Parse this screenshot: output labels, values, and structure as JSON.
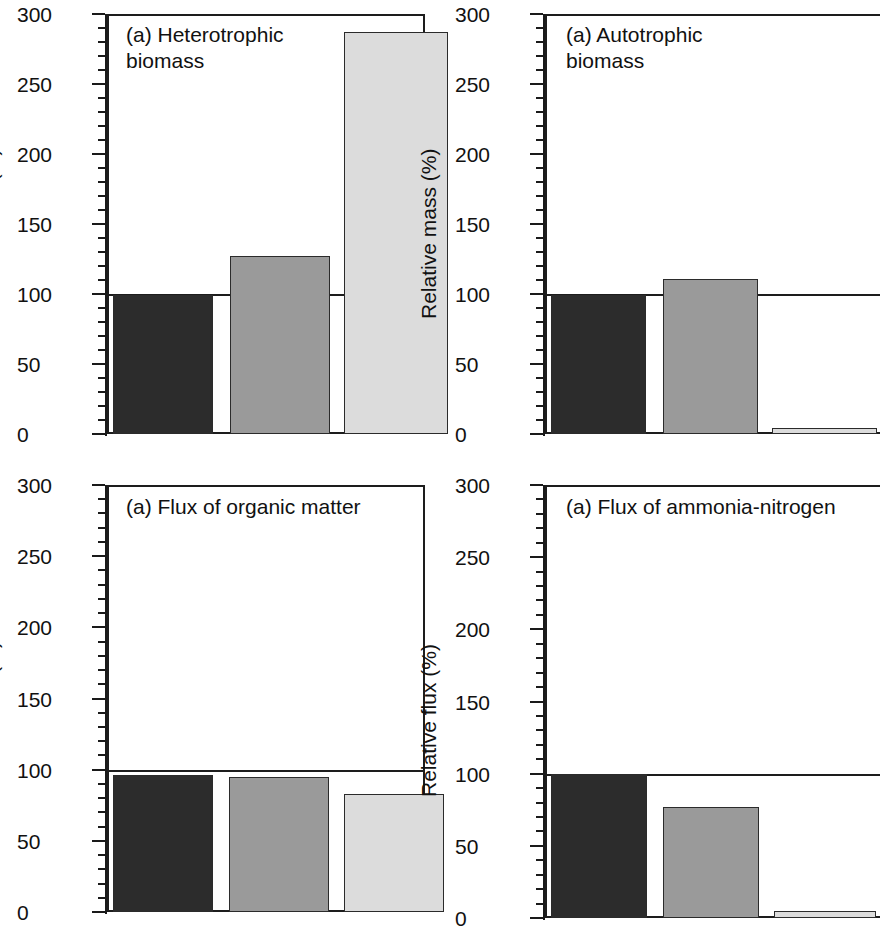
{
  "figure": {
    "background": "#ffffff",
    "panel_count": 4,
    "layout": "2x2 grid of bar charts"
  },
  "colors": {
    "bar_dark": "#2c2c2c",
    "bar_medium": "#9a9a9a",
    "bar_light": "#dcdcdc",
    "axis": "#1a1a1a",
    "text": "#111111"
  },
  "chart_data": [
    {
      "type": "bar",
      "panel_id": "heterotrophic-biomass",
      "title": "(a) Heterotrophic\n      biomass",
      "title_label": "(a)",
      "title_text": "Heterotrophic biomass",
      "xlabel": "",
      "ylabel": "Relative mass (%)",
      "ylim": [
        0,
        300
      ],
      "yticks": [
        0,
        50,
        100,
        150,
        200,
        250,
        300
      ],
      "ytick_labels": [
        "0",
        "50",
        "100",
        "150",
        "200",
        "250",
        "300"
      ],
      "minor_tick_step": 10,
      "grid": false,
      "reference_line": 100,
      "categories": [
        "1",
        "2",
        "3"
      ],
      "values": [
        99,
        127,
        287
      ],
      "bar_colors": [
        "#2c2c2c",
        "#9a9a9a",
        "#dcdcdc"
      ],
      "legend_position": "none"
    },
    {
      "type": "bar",
      "panel_id": "autotrophic-biomass",
      "title": "(a) Autotrophic\n      biomass",
      "title_label": "(a)",
      "title_text": "Autotrophic biomass",
      "xlabel": "",
      "ylabel": "Relative mass (%)",
      "ylim": [
        0,
        300
      ],
      "yticks": [
        0,
        50,
        100,
        150,
        200,
        250,
        300
      ],
      "ytick_labels": [
        "0",
        "50",
        "100",
        "150",
        "200",
        "250",
        "300"
      ],
      "minor_tick_step": 10,
      "grid": false,
      "reference_line": 100,
      "categories": [
        "1",
        "2",
        "3"
      ],
      "values": [
        99,
        111,
        4
      ],
      "bar_colors": [
        "#2c2c2c",
        "#9a9a9a",
        "#dcdcdc"
      ],
      "legend_position": "none"
    },
    {
      "type": "bar",
      "panel_id": "flux-organic-matter",
      "title": "(a) Flux of organic matter",
      "title_label": "(a)",
      "title_text": "Flux of organic matter",
      "xlabel": "",
      "ylabel": "Relative flux (%)",
      "ylim": [
        0,
        300
      ],
      "yticks": [
        0,
        50,
        100,
        150,
        200,
        250,
        300
      ],
      "ytick_labels": [
        "0",
        "50",
        "100",
        "150",
        "200",
        "250",
        "300"
      ],
      "minor_tick_step": 10,
      "grid": false,
      "reference_line": 100,
      "categories": [
        "1",
        "2",
        "3"
      ],
      "values": [
        96,
        95,
        83
      ],
      "bar_colors": [
        "#2c2c2c",
        "#9a9a9a",
        "#dcdcdc"
      ],
      "legend_position": "none"
    },
    {
      "type": "bar",
      "panel_id": "flux-ammonia-nitrogen",
      "title": "(a) Flux of ammonia-nitrogen",
      "title_label": "(a)",
      "title_text": "Flux of ammonia-nitrogen",
      "xlabel": "",
      "ylabel": "Relative flux (%)",
      "ylim": [
        0,
        300
      ],
      "yticks": [
        0,
        50,
        100,
        150,
        200,
        250,
        300
      ],
      "ytick_labels": [
        "0",
        "50",
        "100",
        "150",
        "200",
        "250",
        "300"
      ],
      "minor_tick_step": 10,
      "grid": false,
      "reference_line": 100,
      "categories": [
        "1",
        "2",
        "3"
      ],
      "values": [
        100,
        77,
        5
      ],
      "bar_colors": [
        "#2c2c2c",
        "#9a9a9a",
        "#dcdcdc"
      ],
      "legend_position": "none"
    }
  ]
}
